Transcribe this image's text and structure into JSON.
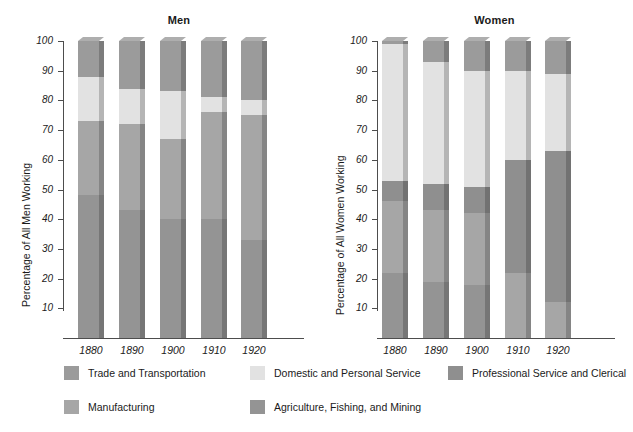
{
  "figure": {
    "width": 633,
    "height": 432,
    "background": "#ffffff"
  },
  "chart_data": {
    "type": "bar",
    "subtype": "stacked-100-percent",
    "title": "",
    "panels": [
      {
        "name": "men",
        "title": "Men",
        "xlabel": "",
        "ylabel": "Percentage of All Men Working",
        "ylim": [
          0,
          100
        ],
        "yticks": [
          10,
          20,
          30,
          40,
          50,
          60,
          70,
          80,
          90,
          100
        ],
        "grid": false,
        "categories": [
          "1880",
          "1890",
          "1900",
          "1910",
          "1920"
        ],
        "series": [
          {
            "name": "Agriculture, Fishing, and Mining",
            "values": [
              48,
              43,
              40,
              40,
              33
            ]
          },
          {
            "name": "Manufacturing",
            "values": [
              25,
              29,
              27,
              36,
              42
            ]
          },
          {
            "name": "Domestic and Personal Service",
            "values": [
              15,
              12,
              16,
              5,
              5
            ]
          },
          {
            "name": "Trade and Transportation",
            "values": [
              12,
              16,
              17,
              19,
              20
            ]
          }
        ],
        "stack_order_bottom_to_top": [
          "Agriculture, Fishing, and Mining",
          "Manufacturing",
          "Domestic and Personal Service",
          "Trade and Transportation"
        ],
        "stacked_boundaries": {
          "1880": [
            0,
            48,
            73,
            88,
            100
          ],
          "1890": [
            0,
            43,
            72,
            84,
            100
          ],
          "1900": [
            0,
            40,
            67,
            83,
            100
          ],
          "1910": [
            0,
            40,
            76,
            81,
            100
          ],
          "1920": [
            0,
            33,
            75,
            80,
            100
          ]
        }
      },
      {
        "name": "women",
        "title": "Women",
        "xlabel": "",
        "ylabel": "Percentage of All Women Working",
        "ylim": [
          0,
          100
        ],
        "yticks": [
          10,
          20,
          30,
          40,
          50,
          60,
          70,
          80,
          90,
          100
        ],
        "grid": false,
        "categories": [
          "1880",
          "1890",
          "1900",
          "1910",
          "1920"
        ],
        "series": [
          {
            "name": "Agriculture, Fishing, and Mining",
            "values": [
              22,
              19,
              18,
              0,
              0
            ]
          },
          {
            "name": "Manufacturing",
            "values": [
              24,
              24,
              24,
              22,
              12
            ]
          },
          {
            "name": "Professional Service and Clerical",
            "values": [
              7,
              9,
              9,
              38,
              51
            ]
          },
          {
            "name": "Domestic and Personal Service",
            "values": [
              46,
              41,
              39,
              30,
              26
            ]
          },
          {
            "name": "Trade and Transportation",
            "values": [
              1,
              7,
              10,
              10,
              11
            ]
          }
        ],
        "stack_order_bottom_to_top": [
          "Agriculture, Fishing, and Mining",
          "Manufacturing",
          "Professional Service and Clerical",
          "Domestic and Personal Service",
          "Trade and Transportation"
        ],
        "stacked_boundaries": {
          "1880": [
            0,
            22,
            46,
            53,
            99,
            100
          ],
          "1890": [
            0,
            19,
            43,
            52,
            93,
            100
          ],
          "1900": [
            0,
            18,
            42,
            51,
            90,
            100
          ],
          "1910": [
            0,
            0,
            22,
            60,
            90,
            100
          ],
          "1920": [
            0,
            0,
            12,
            63,
            89,
            100
          ]
        }
      }
    ],
    "legend": {
      "position": "bottom",
      "entries": [
        {
          "label": "Trade and Transportation",
          "color": "#9b9b9b"
        },
        {
          "label": "Domestic and Personal Service",
          "color": "#e2e2e2"
        },
        {
          "label": "Professional Service and Clerical",
          "color": "#8f8f8f"
        },
        {
          "label": "Manufacturing",
          "color": "#a6a6a6"
        },
        {
          "label": "Agriculture, Fishing, and Mining",
          "color": "#949494"
        }
      ]
    },
    "colors": {
      "trade_and_transportation": "#9b9b9b",
      "domestic_and_personal_service": "#e2e2e2",
      "professional_service_and_clerical": "#8f8f8f",
      "manufacturing": "#a6a6a6",
      "agriculture_fishing_and_mining": "#949494",
      "axis": "#4d4d4d",
      "text": "#1a1a1a"
    }
  }
}
